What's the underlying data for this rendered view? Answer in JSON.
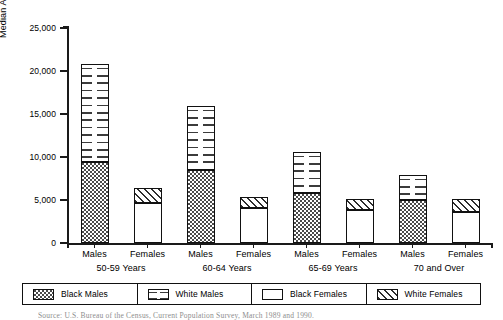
{
  "chart_data": {
    "type": "bar",
    "title": "",
    "xlabel": "",
    "ylabel": "Median Annual Income in Dollars",
    "ylim": [
      0,
      25000
    ],
    "ytick_values": [
      0,
      5000,
      10000,
      15000,
      20000,
      25000
    ],
    "ytick_labels": [
      "0",
      "5,000",
      "10,000",
      "15,000",
      "20,000",
      "25,000"
    ],
    "grid": false,
    "stacked": true,
    "legend_position": "bottom",
    "legend": [
      "Black Males",
      "White Males",
      "Black Females",
      "White Females"
    ],
    "groups": [
      {
        "label": "50-59 Years",
        "bars": [
          {
            "label": "Males",
            "segments": [
              {
                "name": "Black Males",
                "value": 9400
              },
              {
                "name": "White Males",
                "value": 11400
              }
            ],
            "total": 20800
          },
          {
            "label": "Females",
            "segments": [
              {
                "name": "Black Females",
                "value": 4700
              },
              {
                "name": "White Females",
                "value": 1700
              }
            ],
            "total": 6400
          }
        ]
      },
      {
        "label": "60-64 Years",
        "bars": [
          {
            "label": "Males",
            "segments": [
              {
                "name": "Black Males",
                "value": 8500
              },
              {
                "name": "White Males",
                "value": 7400
              }
            ],
            "total": 15900
          },
          {
            "label": "Females",
            "segments": [
              {
                "name": "Black Females",
                "value": 4100
              },
              {
                "name": "White Females",
                "value": 1200
              }
            ],
            "total": 5300
          }
        ]
      },
      {
        "label": "65-69 Years",
        "bars": [
          {
            "label": "Males",
            "segments": [
              {
                "name": "Black Males",
                "value": 5800
              },
              {
                "name": "White Males",
                "value": 4800
              }
            ],
            "total": 10600
          },
          {
            "label": "Females",
            "segments": [
              {
                "name": "Black Females",
                "value": 3800
              },
              {
                "name": "White Females",
                "value": 1300
              }
            ],
            "total": 5100
          }
        ]
      },
      {
        "label": "70 and Over",
        "bars": [
          {
            "label": "Males",
            "segments": [
              {
                "name": "Black Males",
                "value": 5000
              },
              {
                "name": "White Males",
                "value": 2900
              }
            ],
            "total": 7900
          },
          {
            "label": "Females",
            "segments": [
              {
                "name": "Black Females",
                "value": 3600
              },
              {
                "name": "White Females",
                "value": 1500
              }
            ],
            "total": 5100
          }
        ]
      }
    ]
  },
  "caption": "Source: U.S. Bureau of the Census, Current Population Survey, March 1989 and 1990."
}
